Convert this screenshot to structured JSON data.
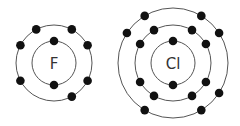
{
  "atoms": [
    {
      "symbol": "F",
      "center": [
        54,
        63
      ],
      "shells": [
        {
          "radius": 22,
          "electrons": 2,
          "angles": [
            -90,
            90
          ]
        },
        {
          "radius": 38,
          "electrons": 7,
          "angles": [
            -118,
            -62,
            -28,
            28,
            62,
            152,
            -152
          ]
        }
      ]
    },
    {
      "symbol": "Cl",
      "center": [
        173,
        63
      ],
      "shells": [
        {
          "radius": 22,
          "electrons": 2,
          "angles": [
            -90,
            90
          ]
        },
        {
          "radius": 38,
          "electrons": 8,
          "angles": [
            -120,
            -60,
            -30,
            30,
            60,
            120,
            150,
            -150
          ]
        },
        {
          "radius": 55,
          "electrons": 7,
          "angles": [
            -121,
            -59,
            -33,
            33,
            59,
            121,
            -147
          ]
        }
      ]
    }
  ],
  "colors": {
    "shell": "#555555",
    "electron": "#111111",
    "label": "#333333"
  }
}
